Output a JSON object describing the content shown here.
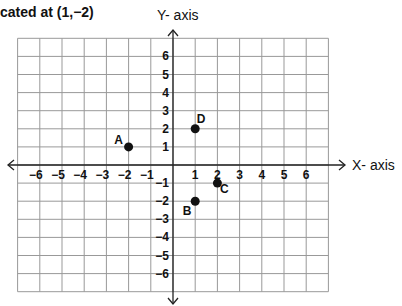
{
  "title": "cated at (1,−2)",
  "chart_data": {
    "type": "scatter",
    "xlabel": "X- axis",
    "ylabel": "Y- axis",
    "xlim": [
      -7,
      7
    ],
    "ylim": [
      -7,
      7
    ],
    "grid": true,
    "x_ticks": [
      "−6",
      "−5",
      "−4",
      "−3",
      "−2",
      "−1",
      "1",
      "2",
      "3",
      "4",
      "5",
      "6"
    ],
    "y_ticks": [
      "6",
      "5",
      "4",
      "3",
      "2",
      "1",
      "−1",
      "−2",
      "−3",
      "−4",
      "−5",
      "−6"
    ],
    "points": [
      {
        "label": "A",
        "x": -2,
        "y": 1
      },
      {
        "label": "B",
        "x": 1,
        "y": -2
      },
      {
        "label": "C",
        "x": 2,
        "y": -1
      },
      {
        "label": "D",
        "x": 1,
        "y": 2
      }
    ]
  },
  "axes": {
    "x_label": "X- axis",
    "y_label": "Y- axis"
  }
}
